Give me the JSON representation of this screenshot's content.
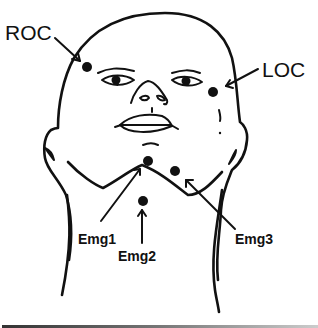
{
  "figure": {
    "labels": {
      "roc": "ROC",
      "loc": "LOC",
      "emg1": "Emg1",
      "emg2": "Emg2",
      "emg3": "Emg3"
    },
    "electrodes": [
      {
        "id": "roc",
        "x": 87,
        "y": 67
      },
      {
        "id": "loc",
        "x": 213,
        "y": 92
      },
      {
        "id": "emg1",
        "x": 148,
        "y": 161
      },
      {
        "id": "emg3",
        "x": 175,
        "y": 171
      },
      {
        "id": "emg2",
        "x": 143,
        "y": 201
      }
    ],
    "colors": {
      "ink": "#111111",
      "background": "#ffffff"
    }
  }
}
